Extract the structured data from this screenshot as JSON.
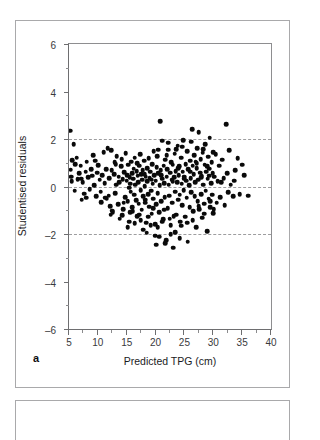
{
  "figure": {
    "panel_letter": "a",
    "background_color": "#ffffff",
    "border_color": "#a9a9ab"
  },
  "chart_data": {
    "type": "scatter",
    "title": "",
    "subtitle": "",
    "xlabel": "Predicted TPG (cm)",
    "ylabel": "Studentised residuals",
    "xlim": [
      5,
      40
    ],
    "ylim": [
      -6,
      6
    ],
    "xticks": [
      5,
      10,
      15,
      20,
      25,
      30,
      35,
      40
    ],
    "xtick_labels": [
      "5",
      "10",
      "15",
      "20",
      "25",
      "30",
      "35",
      "40"
    ],
    "yticks": [
      6,
      4,
      2,
      0,
      -2,
      -4,
      -6
    ],
    "ytick_labels": [
      "6",
      "4",
      "2",
      "0",
      "–2",
      "–4",
      "–6"
    ],
    "grid": false,
    "legend": null,
    "marker": {
      "shape": "circle",
      "color": "#0a0a0a",
      "size_px": 4.6
    },
    "reference_lines": [
      {
        "y": 2,
        "style": "dashed",
        "color": "#9d9d9f"
      },
      {
        "y": 0,
        "style": "dashed",
        "color": "#9d9d9f"
      },
      {
        "y": -2,
        "style": "dashed",
        "color": "#9d9d9f"
      }
    ],
    "n_points": 281,
    "points": [
      [
        5.2,
        2.35
      ],
      [
        5.3,
        0.7
      ],
      [
        5.4,
        0.42
      ],
      [
        5.5,
        0.22
      ],
      [
        5.6,
        1.1
      ],
      [
        5.8,
        1.78
      ],
      [
        6.1,
        0.95
      ],
      [
        6.3,
        1.22
      ],
      [
        6.5,
        0.3
      ],
      [
        6.8,
        0.55
      ],
      [
        7.0,
        0.88
      ],
      [
        7.2,
        -0.55
      ],
      [
        7.4,
        0.18
      ],
      [
        7.6,
        -0.3
      ],
      [
        7.9,
        0.62
      ],
      [
        8.1,
        1.05
      ],
      [
        8.3,
        0.38
      ],
      [
        8.6,
        -0.12
      ],
      [
        8.8,
        0.72
      ],
      [
        9.0,
        0.45
      ],
      [
        9.2,
        1.32
      ],
      [
        9.4,
        0.05
      ],
      [
        9.7,
        -0.42
      ],
      [
        9.9,
        0.58
      ],
      [
        10.1,
        0.9
      ],
      [
        10.3,
        0.28
      ],
      [
        10.6,
        -0.65
      ],
      [
        10.8,
        0.48
      ],
      [
        11.0,
        1.45
      ],
      [
        11.2,
        0.15
      ],
      [
        11.3,
        -0.48
      ],
      [
        11.5,
        -0.52
      ],
      [
        11.7,
        1.62
      ],
      [
        11.9,
        -0.38
      ],
      [
        12.0,
        0.35
      ],
      [
        12.2,
        -1.18
      ],
      [
        12.4,
        0.68
      ],
      [
        12.6,
        -1.08
      ],
      [
        12.8,
        0.52
      ],
      [
        13.0,
        -0.28
      ],
      [
        13.1,
        0.95
      ],
      [
        13.3,
        1.28
      ],
      [
        13.5,
        -0.75
      ],
      [
        13.6,
        0.42
      ],
      [
        13.8,
        -1.35
      ],
      [
        14.0,
        0.85
      ],
      [
        14.1,
        1.15
      ],
      [
        14.3,
        0.3
      ],
      [
        14.4,
        -0.95
      ],
      [
        14.6,
        0.6
      ],
      [
        14.7,
        -0.45
      ],
      [
        14.8,
        1.4
      ],
      [
        15.0,
        0.25
      ],
      [
        15.1,
        0.48
      ],
      [
        15.2,
        -0.62
      ],
      [
        15.3,
        0.92
      ],
      [
        15.4,
        -1.48
      ],
      [
        15.5,
        0.38
      ],
      [
        15.6,
        0.12
      ],
      [
        15.7,
        -0.22
      ],
      [
        15.8,
        1.05
      ],
      [
        15.9,
        0.55
      ],
      [
        16.0,
        -0.88
      ],
      [
        16.1,
        0.32
      ],
      [
        16.2,
        0.75
      ],
      [
        16.3,
        -0.35
      ],
      [
        16.4,
        1.22
      ],
      [
        16.5,
        0.08
      ],
      [
        16.6,
        -0.58
      ],
      [
        16.7,
        0.65
      ],
      [
        16.8,
        -1.25
      ],
      [
        16.9,
        0.45
      ],
      [
        17.0,
        0.18
      ],
      [
        17.1,
        -0.72
      ],
      [
        17.2,
        0.88
      ],
      [
        17.3,
        1.35
      ],
      [
        17.4,
        -0.15
      ],
      [
        17.5,
        0.52
      ],
      [
        17.6,
        -0.98
      ],
      [
        17.7,
        0.28
      ],
      [
        17.8,
        0.68
      ],
      [
        17.9,
        -0.42
      ],
      [
        18.0,
        1.08
      ],
      [
        18.1,
        0.02
      ],
      [
        18.2,
        -0.68
      ],
      [
        18.3,
        0.42
      ],
      [
        18.4,
        -1.52
      ],
      [
        18.5,
        0.78
      ],
      [
        18.6,
        0.22
      ],
      [
        18.7,
        -0.32
      ],
      [
        18.8,
        1.18
      ],
      [
        18.9,
        -0.85
      ],
      [
        19.0,
        0.35
      ],
      [
        19.1,
        0.62
      ],
      [
        19.2,
        -0.18
      ],
      [
        19.3,
        -1.15
      ],
      [
        19.4,
        0.95
      ],
      [
        19.5,
        0.12
      ],
      [
        19.6,
        -0.52
      ],
      [
        19.7,
        1.48
      ],
      [
        19.8,
        0.48
      ],
      [
        19.9,
        -2.08
      ],
      [
        20.0,
        0.25
      ],
      [
        20.1,
        -0.75
      ],
      [
        20.2,
        0.82
      ],
      [
        20.3,
        1.28
      ],
      [
        20.4,
        -0.28
      ],
      [
        20.5,
        0.55
      ],
      [
        20.6,
        -1.08
      ],
      [
        20.7,
        0.05
      ],
      [
        20.8,
        2.75
      ],
      [
        20.9,
        0.68
      ],
      [
        21.0,
        -0.62
      ],
      [
        21.1,
        1.92
      ],
      [
        21.2,
        0.32
      ],
      [
        21.3,
        -1.38
      ],
      [
        21.4,
        0.88
      ],
      [
        21.5,
        0.15
      ],
      [
        21.6,
        -0.45
      ],
      [
        21.7,
        1.12
      ],
      [
        21.8,
        -2.25
      ],
      [
        21.9,
        0.42
      ],
      [
        22.0,
        0.72
      ],
      [
        22.1,
        -0.92
      ],
      [
        22.2,
        1.55
      ],
      [
        22.3,
        0.08
      ],
      [
        22.4,
        -0.38
      ],
      [
        22.5,
        0.58
      ],
      [
        22.6,
        -1.62
      ],
      [
        22.7,
        1.02
      ],
      [
        22.8,
        0.28
      ],
      [
        22.9,
        -0.68
      ],
      [
        23.0,
        0.92
      ],
      [
        23.1,
        -2.58
      ],
      [
        23.2,
        0.38
      ],
      [
        23.3,
        1.38
      ],
      [
        23.4,
        -0.22
      ],
      [
        23.5,
        0.65
      ],
      [
        23.6,
        -1.18
      ],
      [
        23.7,
        0.18
      ],
      [
        23.8,
        1.72
      ],
      [
        23.9,
        -0.55
      ],
      [
        24.0,
        0.48
      ],
      [
        24.1,
        0.85
      ],
      [
        24.2,
        -0.35
      ],
      [
        24.3,
        -1.48
      ],
      [
        24.4,
        1.22
      ],
      [
        24.5,
        0.12
      ],
      [
        24.6,
        -0.78
      ],
      [
        24.7,
        0.62
      ],
      [
        24.8,
        1.95
      ],
      [
        24.9,
        -0.15
      ],
      [
        25.0,
        0.42
      ],
      [
        25.1,
        -1.28
      ],
      [
        25.2,
        0.95
      ],
      [
        25.3,
        0.25
      ],
      [
        25.4,
        -0.48
      ],
      [
        25.5,
        1.48
      ],
      [
        25.6,
        -2.32
      ],
      [
        25.7,
        0.72
      ],
      [
        25.8,
        0.05
      ],
      [
        25.9,
        -0.88
      ],
      [
        26.0,
        1.08
      ],
      [
        26.1,
        0.35
      ],
      [
        26.2,
        -0.25
      ],
      [
        26.3,
        2.42
      ],
      [
        26.4,
        0.88
      ],
      [
        26.5,
        -1.05
      ],
      [
        26.6,
        0.52
      ],
      [
        26.7,
        1.32
      ],
      [
        26.8,
        -0.42
      ],
      [
        26.9,
        0.18
      ],
      [
        27.0,
        -1.72
      ],
      [
        27.1,
        0.78
      ],
      [
        27.2,
        1.62
      ],
      [
        27.3,
        -0.62
      ],
      [
        27.4,
        0.28
      ],
      [
        27.5,
        2.28
      ],
      [
        27.6,
        -0.95
      ],
      [
        27.7,
        0.58
      ],
      [
        27.8,
        1.15
      ],
      [
        27.9,
        -0.32
      ],
      [
        28.0,
        0.45
      ],
      [
        28.1,
        -1.32
      ],
      [
        28.2,
        1.42
      ],
      [
        28.3,
        0.08
      ],
      [
        28.4,
        -0.72
      ],
      [
        28.5,
        0.92
      ],
      [
        28.6,
        1.78
      ],
      [
        28.7,
        -0.18
      ],
      [
        28.8,
        0.62
      ],
      [
        28.9,
        -1.88
      ],
      [
        29.0,
        0.32
      ],
      [
        29.1,
        1.25
      ],
      [
        29.2,
        -0.52
      ],
      [
        29.3,
        0.75
      ],
      [
        29.4,
        2.05
      ],
      [
        29.5,
        -0.88
      ],
      [
        29.6,
        0.15
      ],
      [
        29.7,
        1.02
      ],
      [
        29.8,
        -0.35
      ],
      [
        29.9,
        0.55
      ],
      [
        30.0,
        -1.12
      ],
      [
        30.2,
        0.42
      ],
      [
        30.4,
        1.35
      ],
      [
        30.6,
        -0.68
      ],
      [
        30.8,
        0.22
      ],
      [
        31.0,
        0.88
      ],
      [
        31.2,
        -0.45
      ],
      [
        31.5,
        1.12
      ],
      [
        31.8,
        0.35
      ],
      [
        32.0,
        -0.78
      ],
      [
        32.2,
        2.62
      ],
      [
        32.4,
        0.55
      ],
      [
        32.6,
        -0.25
      ],
      [
        32.8,
        1.52
      ],
      [
        33.0,
        0.08
      ],
      [
        33.4,
        -0.42
      ],
      [
        33.8,
        0.68
      ],
      [
        34.2,
        1.18
      ],
      [
        34.6,
        -0.32
      ],
      [
        35.0,
        0.92
      ],
      [
        35.4,
        0.48
      ],
      [
        36.0,
        -0.38
      ],
      [
        6.0,
        -0.18
      ],
      [
        7.1,
        0.32
      ],
      [
        8.0,
        -0.48
      ],
      [
        9.5,
        1.08
      ],
      [
        10.5,
        -0.22
      ],
      [
        11.4,
        0.72
      ],
      [
        12.1,
        -0.82
      ],
      [
        12.9,
        1.02
      ],
      [
        13.7,
        0.18
      ],
      [
        14.5,
        -0.68
      ],
      [
        15.45,
        -0.05
      ],
      [
        16.05,
        -1.05
      ],
      [
        16.85,
        0.98
      ],
      [
        17.45,
        -1.42
      ],
      [
        18.15,
        0.52
      ],
      [
        18.75,
        -1.28
      ],
      [
        19.35,
        0.28
      ],
      [
        19.95,
        -1.58
      ],
      [
        20.35,
        -1.72
      ],
      [
        20.95,
        0.48
      ],
      [
        21.45,
        -0.98
      ],
      [
        21.95,
        1.32
      ],
      [
        22.45,
        -1.35
      ],
      [
        22.95,
        0.22
      ],
      [
        23.45,
        -1.92
      ],
      [
        23.95,
        0.78
      ],
      [
        24.45,
        -1.65
      ],
      [
        24.95,
        0.32
      ],
      [
        25.45,
        -1.52
      ],
      [
        25.95,
        0.62
      ],
      [
        26.45,
        -1.42
      ],
      [
        26.95,
        1.05
      ],
      [
        27.45,
        -0.82
      ],
      [
        27.95,
        0.38
      ],
      [
        28.45,
        -1.15
      ],
      [
        28.95,
        0.85
      ],
      [
        29.45,
        -0.62
      ],
      [
        29.95,
        1.45
      ],
      [
        15.15,
        -1.72
      ],
      [
        16.35,
        -1.55
      ],
      [
        17.85,
        -1.82
      ],
      [
        18.45,
        -1.95
      ],
      [
        19.15,
        -1.62
      ],
      [
        20.65,
        -2.12
      ],
      [
        21.15,
        -1.48
      ],
      [
        22.65,
        -2.02
      ],
      [
        23.15,
        -1.25
      ],
      [
        24.15,
        -2.18
      ],
      [
        20.15,
        -2.45
      ],
      [
        21.65,
        -2.38
      ],
      [
        12.5,
        -1.02
      ],
      [
        13.2,
        0.08
      ],
      [
        14.2,
        -1.22
      ],
      [
        15.65,
        -1.08
      ],
      [
        17.15,
        -1.18
      ],
      [
        18.25,
        -0.55
      ],
      [
        19.55,
        -0.92
      ],
      [
        20.45,
        1.55
      ],
      [
        22.15,
        1.85
      ],
      [
        23.55,
        1.58
      ],
      [
        24.65,
        1.68
      ],
      [
        26.15,
        1.88
      ],
      [
        27.15,
        0.98
      ],
      [
        28.25,
        1.58
      ],
      [
        29.25,
        0.45
      ],
      [
        30.1,
        -0.95
      ],
      [
        31.4,
        0.18
      ],
      [
        33.6,
        0.25
      ],
      [
        12.3,
        1.52
      ]
    ]
  }
}
